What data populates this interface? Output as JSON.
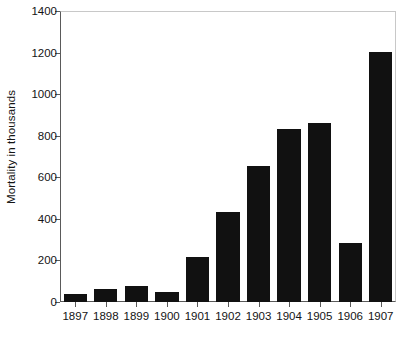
{
  "chart_data": {
    "type": "bar",
    "title": "",
    "subtitle": "",
    "xlabel": "",
    "ylabel": "Mortality in thousands",
    "categories": [
      "1897",
      "1898",
      "1899",
      "1900",
      "1901",
      "1902",
      "1903",
      "1904",
      "1905",
      "1906",
      "1907"
    ],
    "values": [
      40,
      62,
      77,
      50,
      215,
      433,
      655,
      833,
      862,
      283,
      1205
    ],
    "series": [
      {
        "name": "Mortality",
        "values": [
          40,
          62,
          77,
          50,
          215,
          433,
          655,
          833,
          862,
          283,
          1205
        ]
      }
    ],
    "ylim": [
      0,
      1400
    ],
    "yticks": [
      0,
      200,
      400,
      600,
      800,
      1000,
      1200,
      1400
    ],
    "ytick_labels": [
      "0",
      "200",
      "400",
      "600",
      "800",
      "1000",
      "1200",
      "1400"
    ],
    "xtick_labels": [
      "1897",
      "1898",
      "1899",
      "1900",
      "1901",
      "1902",
      "1903",
      "1904",
      "1905",
      "1906",
      "1907"
    ],
    "grid": false,
    "legend": false,
    "legend_position": "none",
    "bar_color": "#111111",
    "axis_color": "#5a5a5a",
    "frame_color": "#c8c8c8",
    "background_color": "#ffffff",
    "text_color": "#141414"
  }
}
